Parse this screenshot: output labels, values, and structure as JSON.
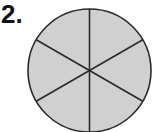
{
  "problem": {
    "number_label": "2."
  },
  "figure": {
    "shape": "circle",
    "total_parts": 6,
    "shaded_parts": 6,
    "fill_color": "#d0d0d0",
    "stroke_color": "#2a2a2a",
    "center": [
      89.5,
      70.5
    ],
    "radius": 61.5
  }
}
